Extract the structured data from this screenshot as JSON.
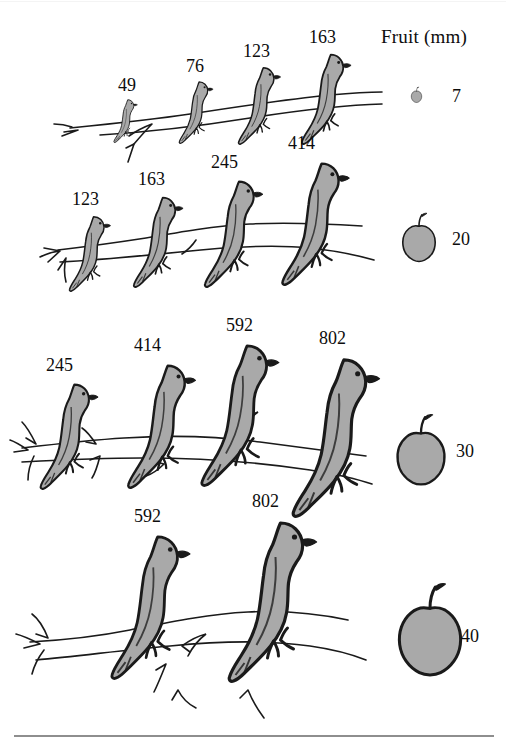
{
  "figure": {
    "fruit_column_header": "Fruit (mm)",
    "bird_fill_color": "#a9a9a9",
    "outline_color": "#1a1a1a",
    "background_color": "#ffffff",
    "rule_color": "#8e8e8e"
  },
  "chart_data": {
    "type": "table",
    "title": "",
    "xlabel": "",
    "ylabel": "",
    "columns": [
      "Bird gape sizes (mm) per row",
      "Fruit (mm)"
    ],
    "legend_entries": [
      "Fruit (mm)"
    ],
    "rows": [
      {
        "index": 1,
        "birds": [
          49,
          76,
          123,
          163
        ],
        "fruit": 7
      },
      {
        "index": 2,
        "birds": [
          123,
          163,
          245,
          414
        ],
        "fruit": 20
      },
      {
        "index": 3,
        "birds": [
          245,
          414,
          592,
          802
        ],
        "fruit": 30
      },
      {
        "index": 4,
        "birds": [
          592,
          802
        ],
        "fruit": 40
      }
    ],
    "bird_values": [
      49,
      76,
      123,
      163,
      123,
      163,
      245,
      414,
      245,
      414,
      592,
      802,
      592,
      802
    ],
    "fruit_values": [
      7,
      20,
      30,
      40
    ]
  },
  "rows": [
    {
      "name": "row-1",
      "birds": [
        {
          "label": "49",
          "height": 46,
          "x": 110,
          "y": 97,
          "label_x": 118,
          "label_y": 76
        },
        {
          "label": "76",
          "height": 66,
          "x": 174,
          "y": 78,
          "label_x": 186,
          "label_y": 57
        },
        {
          "label": "123",
          "height": 82,
          "x": 232,
          "y": 63,
          "label_x": 243,
          "label_y": 42
        },
        {
          "label": "163",
          "height": 96,
          "x": 294,
          "y": 49,
          "label_x": 309,
          "label_y": 28
        }
      ],
      "fruit": {
        "label": "7",
        "size": 13,
        "x": 410,
        "y": 86,
        "label_x": 452,
        "label_y": 87
      }
    },
    {
      "name": "row-2",
      "birds": [
        {
          "label": "123",
          "height": 80,
          "x": 63,
          "y": 212,
          "label_x": 72,
          "label_y": 190
        },
        {
          "label": "163",
          "height": 96,
          "x": 126,
          "y": 192,
          "label_x": 138,
          "label_y": 170
        },
        {
          "label": "245",
          "height": 113,
          "x": 196,
          "y": 175,
          "label_x": 211,
          "label_y": 153
        },
        {
          "label": "414",
          "height": 130,
          "x": 272,
          "y": 156,
          "label_x": 288,
          "label_y": 134
        }
      ],
      "fruit": {
        "label": "20",
        "size": 40,
        "x": 399,
        "y": 210,
        "label_x": 452,
        "label_y": 230
      }
    },
    {
      "name": "row-3",
      "birds": [
        {
          "label": "245",
          "height": 112,
          "x": 32,
          "y": 378,
          "label_x": 46,
          "label_y": 356
        },
        {
          "label": "414",
          "height": 131,
          "x": 118,
          "y": 358,
          "label_x": 134,
          "label_y": 336
        },
        {
          "label": "592",
          "height": 150,
          "x": 190,
          "y": 337,
          "label_x": 226,
          "label_y": 316
        },
        {
          "label": "802",
          "height": 168,
          "x": 280,
          "y": 350,
          "label_x": 319,
          "label_y": 329
        }
      ],
      "fruit": {
        "label": "30",
        "size": 58,
        "x": 392,
        "y": 410,
        "label_x": 456,
        "label_y": 442
      }
    },
    {
      "name": "row-4",
      "birds": [
        {
          "label": "592",
          "height": 152,
          "x": 100,
          "y": 528,
          "label_x": 134,
          "label_y": 507
        },
        {
          "label": "802",
          "height": 170,
          "x": 216,
          "y": 513,
          "label_x": 252,
          "label_y": 492
        }
      ],
      "fruit": {
        "label": "40",
        "size": 76,
        "x": 392,
        "y": 578,
        "label_x": 461,
        "label_y": 627
      }
    }
  ]
}
